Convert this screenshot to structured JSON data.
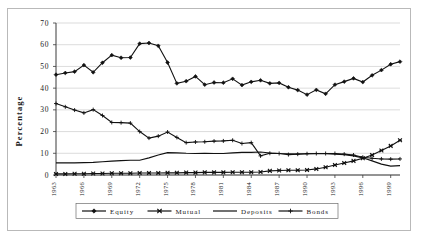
{
  "page": {
    "top_text_fragment": "",
    "background_color": "#ffffff",
    "frame_color": "#b9b9b9"
  },
  "chart_data": {
    "type": "line",
    "title": "",
    "xlabel": "",
    "ylabel": "Percentage",
    "ylim": [
      0,
      70
    ],
    "ytick_step": 10,
    "yticks": [
      0,
      10,
      20,
      30,
      40,
      50,
      60,
      70
    ],
    "grid": true,
    "grid_axis": "y",
    "legend_position": "bottom",
    "x": [
      1963,
      1964,
      1965,
      1966,
      1967,
      1968,
      1969,
      1970,
      1971,
      1972,
      1973,
      1974,
      1975,
      1976,
      1977,
      1978,
      1979,
      1980,
      1981,
      1982,
      1983,
      1984,
      1985,
      1986,
      1987,
      1988,
      1989,
      1990,
      1991,
      1992,
      1993,
      1994,
      1995,
      1996,
      1997,
      1998,
      1999,
      2000
    ],
    "xtick_labels": [
      "1963",
      "1966",
      "1969",
      "1972",
      "1975",
      "1978",
      "1981",
      "1984",
      "1987",
      "1990",
      "1993",
      "1996",
      "1999"
    ],
    "xtick_values": [
      1963,
      1966,
      1969,
      1972,
      1975,
      1978,
      1981,
      1984,
      1987,
      1990,
      1993,
      1996,
      1999
    ],
    "series": [
      {
        "name": "Equity",
        "marker": "diamond",
        "color": "#111111",
        "values": [
          46.2,
          47.0,
          47.6,
          50.6,
          47.3,
          51.7,
          55.2,
          54.0,
          54.1,
          60.5,
          60.8,
          59.5,
          51.8,
          42.2,
          43.2,
          45.4,
          41.6,
          42.6,
          42.5,
          44.3,
          41.4,
          42.9,
          43.6,
          42.2,
          42.4,
          40.4,
          39.1,
          37.0,
          39.2,
          37.4,
          41.6,
          43.0,
          44.5,
          42.8,
          45.9,
          48.3,
          51.0,
          52.2
        ]
      },
      {
        "name": "Mutual",
        "marker": "cross-box",
        "color": "#111111",
        "values": [
          0.5,
          0.5,
          0.6,
          0.6,
          0.7,
          0.7,
          0.8,
          0.8,
          0.8,
          0.9,
          0.9,
          0.9,
          1.0,
          1.0,
          1.1,
          1.1,
          1.2,
          1.2,
          1.2,
          1.3,
          1.3,
          1.3,
          1.4,
          1.9,
          2.1,
          2.2,
          2.2,
          2.3,
          2.8,
          3.6,
          4.6,
          5.5,
          6.5,
          7.7,
          9.2,
          11.3,
          13.4,
          16.0
        ]
      },
      {
        "name": "Deposits",
        "marker": "none",
        "color": "#111111",
        "values": [
          5.6,
          5.6,
          5.6,
          5.7,
          5.8,
          6.1,
          6.4,
          6.6,
          6.8,
          6.8,
          7.9,
          9.2,
          10.3,
          10.2,
          10.0,
          9.9,
          10.0,
          9.9,
          9.9,
          10.2,
          10.4,
          10.4,
          10.6,
          10.1,
          9.9,
          9.8,
          9.7,
          9.8,
          9.9,
          9.8,
          9.6,
          9.3,
          8.8,
          7.9,
          6.5,
          5.0,
          4.1,
          4.3
        ]
      },
      {
        "name": "Bonds",
        "marker": "plus",
        "color": "#111111",
        "values": [
          32.9,
          31.4,
          29.9,
          28.6,
          30.1,
          27.4,
          24.2,
          24.1,
          23.9,
          20.0,
          17.0,
          17.9,
          19.8,
          17.3,
          14.9,
          15.2,
          15.3,
          15.6,
          15.7,
          16.0,
          14.5,
          14.9,
          8.8,
          10.0,
          9.9,
          9.4,
          9.6,
          9.8,
          9.9,
          9.9,
          9.9,
          9.6,
          9.2,
          8.2,
          7.7,
          7.4,
          7.3,
          7.4
        ]
      }
    ]
  },
  "legend": {
    "items": [
      {
        "label": "Equity",
        "marker": "diamond"
      },
      {
        "label": "Mutual",
        "marker": "cross-box"
      },
      {
        "label": "Deposits",
        "marker": "none"
      },
      {
        "label": "Bonds",
        "marker": "plus"
      }
    ]
  }
}
